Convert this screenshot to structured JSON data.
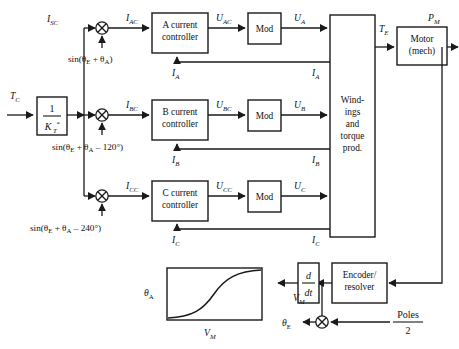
{
  "figure": {
    "type": "block-diagram",
    "background": "#ffffff",
    "line_color": "#1a1a1a",
    "width": 459,
    "height": 349
  },
  "blocks": [
    {
      "id": "gain",
      "label_numerator": "1",
      "label_denominator": "K",
      "denominator_sub": "T",
      "denominator_sup": "*",
      "kind": "transfer-function"
    },
    {
      "id": "ctrl_a",
      "line1": "A current",
      "line2": "controller",
      "kind": "controller"
    },
    {
      "id": "ctrl_b",
      "line1": "B current",
      "line2": "controller",
      "kind": "controller"
    },
    {
      "id": "ctrl_c",
      "line1": "C current",
      "line2": "controller",
      "kind": "controller"
    },
    {
      "id": "mod_a",
      "line1": "Mod",
      "kind": "modulator"
    },
    {
      "id": "mod_b",
      "line1": "Mod",
      "kind": "modulator"
    },
    {
      "id": "mod_c",
      "line1": "Mod",
      "kind": "modulator"
    },
    {
      "id": "windings",
      "lines": [
        "Wind-",
        "ings",
        "and",
        "torque",
        "prod."
      ],
      "kind": "plant"
    },
    {
      "id": "motor",
      "line1": "Motor",
      "line2": "(mech)",
      "kind": "plant"
    },
    {
      "id": "derivative",
      "label_numerator": "d",
      "label_denominator": "dt",
      "kind": "differentiator"
    },
    {
      "id": "encoder",
      "line1": "Encoder/",
      "line2": "resolver",
      "kind": "sensor"
    },
    {
      "id": "inset_plot",
      "ylabel": "θ",
      "ylabel_sub": "A",
      "xlabel": "V",
      "xlabel_sub": "M",
      "kind": "inset-curve"
    }
  ],
  "multipliers": [
    {
      "id": "mul_a",
      "glyph": "⊗",
      "input_label_parts": [
        "sin(θ",
        "E",
        " + θ",
        "A",
        ")"
      ]
    },
    {
      "id": "mul_b",
      "glyph": "⊗",
      "input_label_parts": [
        "sin(θ",
        "E",
        " + θ",
        "A",
        " – 120°)"
      ]
    },
    {
      "id": "mul_c",
      "glyph": "⊗",
      "input_label_parts": [
        "sin(θ",
        "E",
        " + θ",
        "A",
        " – 240°)"
      ]
    },
    {
      "id": "mul_pol",
      "glyph": "⊗",
      "input_label_parts": [
        "Poles",
        "2"
      ]
    }
  ],
  "signals": {
    "tc": {
      "base": "T",
      "sub": "C",
      "full": "T_C"
    },
    "isc": {
      "base": "I",
      "sub": "SC",
      "full": "I_SC"
    },
    "iac": {
      "base": "I",
      "sub": "AC",
      "full": "I_AC"
    },
    "ibc": {
      "base": "I",
      "sub": "BC",
      "full": "I_BC"
    },
    "icc": {
      "base": "I",
      "sub": "CC",
      "full": "I_CC"
    },
    "uac": {
      "base": "U",
      "sub": "AC",
      "full": "U_AC"
    },
    "ubc": {
      "base": "U",
      "sub": "BC",
      "full": "U_BC"
    },
    "ucc": {
      "base": "U",
      "sub": "CC",
      "full": "U_CC"
    },
    "ua": {
      "base": "U",
      "sub": "A",
      "full": "U_A"
    },
    "ub": {
      "base": "U",
      "sub": "B",
      "full": "U_B"
    },
    "uc": {
      "base": "U",
      "sub": "C",
      "full": "U_C"
    },
    "ia1": {
      "base": "I",
      "sub": "A",
      "full": "I_A"
    },
    "ia2": {
      "base": "I",
      "sub": "A",
      "full": "I_A"
    },
    "ib1": {
      "base": "I",
      "sub": "B",
      "full": "I_B"
    },
    "ib2": {
      "base": "I",
      "sub": "B",
      "full": "I_B"
    },
    "ic1": {
      "base": "I",
      "sub": "C",
      "full": "I_C"
    },
    "ic2": {
      "base": "I",
      "sub": "C",
      "full": "I_C"
    },
    "te": {
      "base": "T",
      "sub": "E",
      "full": "T_E"
    },
    "pm": {
      "base": "P",
      "sub": "M",
      "full": "P_M"
    },
    "vm": {
      "base": "V",
      "sub": "M",
      "full": "V_M"
    },
    "thetae": {
      "base": "θ",
      "sub": "E",
      "full": "theta_E"
    }
  },
  "trig_inputs": {
    "phase_a": {
      "prefix": "sin(θ",
      "sub1": "E",
      "mid": " + θ",
      "sub2": "A",
      "suffix": ")"
    },
    "phase_b": {
      "prefix": "sin(θ",
      "sub1": "E",
      "mid": " + θ",
      "sub2": "A",
      "suffix": " – 120°)"
    },
    "phase_c": {
      "prefix": "sin(θ",
      "sub1": "E",
      "mid": " + θ",
      "sub2": "A",
      "suffix": " – 240°)"
    }
  },
  "poles_term": {
    "numerator": "Poles",
    "denominator": "2"
  },
  "inset": {
    "ylabel_base": "θ",
    "ylabel_sub": "A",
    "xlabel_base": "V",
    "xlabel_sub": "M",
    "curve_type": "sigmoid",
    "description": "S-shaped monotonic curve of theta_A versus V_M"
  }
}
